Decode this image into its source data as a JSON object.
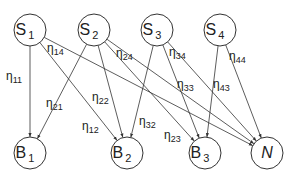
{
  "diagram": {
    "title": "",
    "colors": {
      "stroke": "#333333",
      "text": "#222222",
      "background": "#ffffff"
    },
    "node_radius": 16,
    "sources": [
      {
        "id": "S1",
        "base": "S",
        "sub": "1",
        "x": 30,
        "y": 30
      },
      {
        "id": "S2",
        "base": "S",
        "sub": "2",
        "x": 94,
        "y": 30
      },
      {
        "id": "S3",
        "base": "S",
        "sub": "3",
        "x": 157,
        "y": 30
      },
      {
        "id": "S4",
        "base": "S",
        "sub": "4",
        "x": 220,
        "y": 30
      }
    ],
    "targets": [
      {
        "id": "B1",
        "base": "B",
        "sub": "1",
        "italic": false,
        "x": 30,
        "y": 153
      },
      {
        "id": "B2",
        "base": "B",
        "sub": "2",
        "italic": false,
        "x": 127,
        "y": 153
      },
      {
        "id": "B3",
        "base": "B",
        "sub": "3",
        "italic": false,
        "x": 205,
        "y": 153
      },
      {
        "id": "N",
        "base": "N",
        "sub": "",
        "italic": true,
        "x": 267,
        "y": 153
      }
    ],
    "edges": [
      {
        "from": "S1",
        "to": "B1",
        "label": "η",
        "sub": "11",
        "lx": 6,
        "ly": 80
      },
      {
        "from": "S1",
        "to": "B2",
        "label": "η",
        "sub": "12",
        "lx": 82,
        "ly": 130
      },
      {
        "from": "S1",
        "to": "N",
        "label": "η",
        "sub": "14",
        "lx": 47,
        "ly": 52
      },
      {
        "from": "S2",
        "to": "B1",
        "label": "η",
        "sub": "21",
        "lx": 46,
        "ly": 107
      },
      {
        "from": "S2",
        "to": "B2",
        "label": "η",
        "sub": "22",
        "lx": 92,
        "ly": 101
      },
      {
        "from": "S2",
        "to": "B3",
        "label": "η",
        "sub": "23",
        "lx": 164,
        "ly": 139
      },
      {
        "from": "S2",
        "to": "N",
        "label": "η",
        "sub": "24",
        "lx": 116,
        "ly": 57
      },
      {
        "from": "S3",
        "to": "B2",
        "label": "η",
        "sub": "32",
        "lx": 139,
        "ly": 125
      },
      {
        "from": "S3",
        "to": "B3",
        "label": "η",
        "sub": "33",
        "lx": 177,
        "ly": 88
      },
      {
        "from": "S3",
        "to": "N",
        "label": "η",
        "sub": "34",
        "lx": 169,
        "ly": 56
      },
      {
        "from": "S4",
        "to": "B3",
        "label": "η",
        "sub": "43",
        "lx": 213,
        "ly": 88
      },
      {
        "from": "S4",
        "to": "N",
        "label": "η",
        "sub": "44",
        "lx": 229,
        "ly": 60
      }
    ]
  }
}
